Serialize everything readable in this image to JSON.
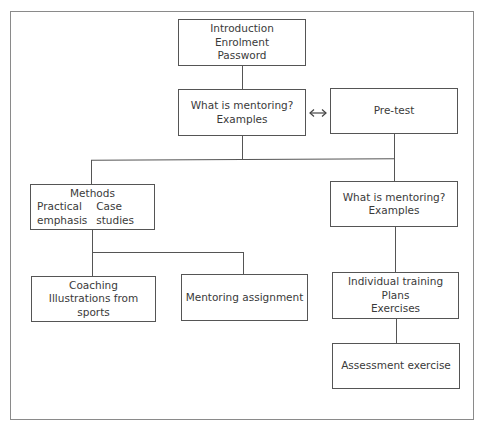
{
  "diagram": {
    "type": "flowchart",
    "nodes": {
      "intro": {
        "lines": [
          "Introduction",
          "Enrolment",
          "Password"
        ]
      },
      "what_left": {
        "lines": [
          "What is mentoring?",
          "Examples"
        ]
      },
      "pretest": {
        "lines": [
          "Pre-test"
        ]
      },
      "methods": {
        "title": "Methods",
        "col1": [
          "Practical",
          "emphasis"
        ],
        "col2": [
          "Case",
          "studies"
        ]
      },
      "what_right": {
        "lines": [
          "What is mentoring?",
          "Examples"
        ]
      },
      "coaching": {
        "lines": [
          "Coaching",
          "Illustrations from sports"
        ]
      },
      "mentoring_assignment": {
        "lines": [
          "Mentoring assignment"
        ]
      },
      "individual": {
        "lines": [
          "Individual training",
          "Plans",
          "Exercises"
        ]
      },
      "assessment": {
        "lines": [
          "Assessment exercise"
        ]
      }
    },
    "edges": [
      {
        "from": "intro",
        "to": "what_left"
      },
      {
        "from": "what_left",
        "to": "pretest",
        "bidirectional": true
      },
      {
        "from": "what_left",
        "to": "methods"
      },
      {
        "from": "pretest",
        "to": "what_right"
      },
      {
        "from": "methods",
        "to": "coaching"
      },
      {
        "from": "methods",
        "to": "mentoring_assignment"
      },
      {
        "from": "what_right",
        "to": "individual"
      },
      {
        "from": "individual",
        "to": "assessment"
      }
    ]
  }
}
